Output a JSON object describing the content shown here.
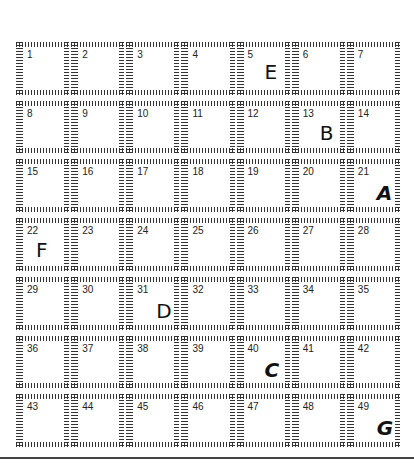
{
  "grid": {
    "rows": 7,
    "columns": 7,
    "cells": [
      {
        "number": "1",
        "letter": ""
      },
      {
        "number": "2",
        "letter": ""
      },
      {
        "number": "3",
        "letter": ""
      },
      {
        "number": "4",
        "letter": ""
      },
      {
        "number": "5",
        "letter": "E",
        "style": "plain",
        "pos": {
          "left": 28,
          "top": 20
        }
      },
      {
        "number": "6",
        "letter": ""
      },
      {
        "number": "7",
        "letter": ""
      },
      {
        "number": "8",
        "letter": ""
      },
      {
        "number": "9",
        "letter": ""
      },
      {
        "number": "10",
        "letter": ""
      },
      {
        "number": "11",
        "letter": ""
      },
      {
        "number": "12",
        "letter": ""
      },
      {
        "number": "13",
        "letter": "B",
        "style": "plain",
        "pos": {
          "left": 28,
          "top": 22
        }
      },
      {
        "number": "14",
        "letter": ""
      },
      {
        "number": "15",
        "letter": ""
      },
      {
        "number": "16",
        "letter": ""
      },
      {
        "number": "17",
        "letter": ""
      },
      {
        "number": "18",
        "letter": ""
      },
      {
        "number": "19",
        "letter": ""
      },
      {
        "number": "20",
        "letter": ""
      },
      {
        "number": "21",
        "letter": "A",
        "style": "script",
        "pos": {
          "left": 30,
          "top": 24
        }
      },
      {
        "number": "22",
        "letter": "F",
        "style": "plain",
        "pos": {
          "left": 20,
          "top": 22
        }
      },
      {
        "number": "23",
        "letter": ""
      },
      {
        "number": "24",
        "letter": ""
      },
      {
        "number": "25",
        "letter": ""
      },
      {
        "number": "26",
        "letter": ""
      },
      {
        "number": "27",
        "letter": ""
      },
      {
        "number": "28",
        "letter": ""
      },
      {
        "number": "29",
        "letter": ""
      },
      {
        "number": "30",
        "letter": ""
      },
      {
        "number": "31",
        "letter": "D",
        "style": "plain",
        "pos": {
          "left": 30,
          "top": 24
        }
      },
      {
        "number": "32",
        "letter": ""
      },
      {
        "number": "33",
        "letter": ""
      },
      {
        "number": "34",
        "letter": ""
      },
      {
        "number": "35",
        "letter": ""
      },
      {
        "number": "36",
        "letter": ""
      },
      {
        "number": "37",
        "letter": ""
      },
      {
        "number": "38",
        "letter": ""
      },
      {
        "number": "39",
        "letter": ""
      },
      {
        "number": "40",
        "letter": "C",
        "style": "script",
        "pos": {
          "left": 28,
          "top": 24
        }
      },
      {
        "number": "41",
        "letter": ""
      },
      {
        "number": "42",
        "letter": ""
      },
      {
        "number": "43",
        "letter": ""
      },
      {
        "number": "44",
        "letter": ""
      },
      {
        "number": "45",
        "letter": ""
      },
      {
        "number": "46",
        "letter": ""
      },
      {
        "number": "47",
        "letter": ""
      },
      {
        "number": "48",
        "letter": ""
      },
      {
        "number": "49",
        "letter": "G",
        "style": "script",
        "pos": {
          "left": 30,
          "top": 24
        }
      }
    ]
  },
  "colors": {
    "hatch": "#333333",
    "text": "#222222",
    "rule": "#444444"
  }
}
